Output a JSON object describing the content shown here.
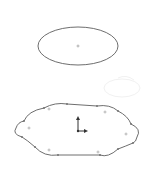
{
  "view": {
    "background": "#ffffff",
    "line_color": "#6e6e6e",
    "point_color": "#9a9a9a",
    "origin_color": "#333333"
  },
  "sketch": {
    "ellipse": {
      "label": "ellipse",
      "cx": 78,
      "cy": 46,
      "rx": 40,
      "ry": 19,
      "center_point": [
        78,
        46
      ]
    },
    "closed_spline": {
      "label": "closed-profile",
      "vertices": [
        [
          44,
          108
        ],
        [
          67,
          104
        ],
        [
          97,
          106
        ],
        [
          118,
          111
        ],
        [
          131,
          124
        ],
        [
          137,
          132
        ],
        [
          133,
          143
        ],
        [
          118,
          149
        ],
        [
          100,
          155
        ],
        [
          58,
          155
        ],
        [
          35,
          147
        ],
        [
          22,
          137
        ],
        [
          16,
          128
        ],
        [
          24,
          121
        ]
      ],
      "arc_centers": [
        [
          49,
          109
        ],
        [
          105,
          112
        ],
        [
          29,
          128
        ],
        [
          126,
          134
        ],
        [
          49,
          150
        ],
        [
          98,
          152
        ]
      ]
    },
    "origin": {
      "label": "origin",
      "x": 78,
      "y": 131,
      "up_length": 14,
      "right_length": 9
    }
  }
}
